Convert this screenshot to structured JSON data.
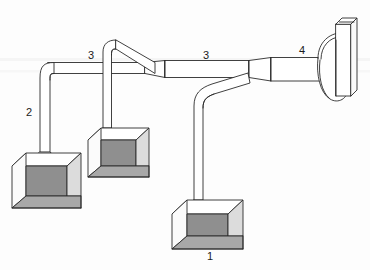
{
  "figure": {
    "type": "line-diagram",
    "background_color": "#fdfdfd",
    "line_color": "#2b2b2b"
  },
  "palette": {
    "duct_fill": "#ffffff",
    "box_front_open": "#ffffff",
    "box_left_face": "#fbfbfb",
    "box_back_wall": "#8f8f8f",
    "box_right_wall": "#dcdcdc",
    "box_floor": "#a8a8a8",
    "box_top_face": "#ffffff",
    "outline": "#2b2b2b",
    "label": "#1b1b1b"
  },
  "labels": [
    {
      "id": "label-1",
      "text": "1",
      "x": 210,
      "y": 257,
      "refers_to": "enclosure-hood-1"
    },
    {
      "id": "label-2",
      "text": "2",
      "x": 29,
      "y": 113,
      "refers_to": "branch-duct-riser-2"
    },
    {
      "id": "label-3a",
      "text": "3",
      "x": 91,
      "y": 56,
      "refers_to": "main-duct-segment-left"
    },
    {
      "id": "label-3b",
      "text": "3",
      "x": 206,
      "y": 56,
      "refers_to": "main-duct-segment-right"
    },
    {
      "id": "label-4",
      "text": "4",
      "x": 302,
      "y": 51,
      "refers_to": "fan-discharge-stack"
    }
  ],
  "components": {
    "enclosures": [
      {
        "name": "enclosure-hood-1",
        "label": "1",
        "position": "bottom-center"
      },
      {
        "name": "enclosure-hood-2",
        "label": "2",
        "position": "bottom-left"
      },
      {
        "name": "enclosure-hood-3",
        "label": "3",
        "position": "middle-left"
      }
    ],
    "ducts": [
      {
        "name": "branch-duct-left",
        "label": "2"
      },
      {
        "name": "branch-duct-middle",
        "label": "3"
      },
      {
        "name": "branch-duct-right",
        "label": "3"
      },
      {
        "name": "main-duct",
        "label": "3"
      }
    ],
    "fan": {
      "name": "fan-housing",
      "label": "4",
      "discharge": "vertical-stack"
    }
  }
}
